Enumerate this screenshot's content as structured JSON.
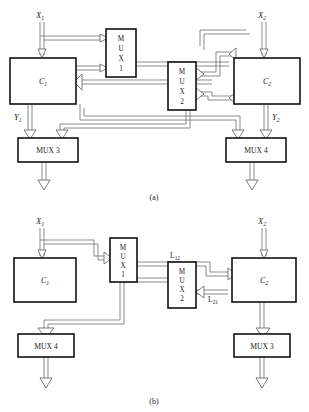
{
  "figure": {
    "captions": {
      "a": "(a)",
      "b": "(b)"
    }
  },
  "diagram_a": {
    "caption": "(a)",
    "inputs": [
      {
        "name": "input-x1",
        "label": "X",
        "sub": "1"
      },
      {
        "name": "input-x2",
        "label": "X",
        "sub": "2"
      }
    ],
    "outputs": [
      {
        "name": "output-y1",
        "label": "Y",
        "sub": "1"
      },
      {
        "name": "output-y2",
        "label": "Y",
        "sub": "2"
      }
    ],
    "blocks": [
      {
        "name": "block-c1",
        "label": "C",
        "sub": "1",
        "orient": "horizontal"
      },
      {
        "name": "block-c2",
        "label": "C",
        "sub": "2",
        "orient": "horizontal"
      },
      {
        "name": "block-mux1",
        "label": "MUX 1",
        "letters": [
          "M",
          "U",
          "X",
          "1"
        ],
        "orient": "vertical"
      },
      {
        "name": "block-mux2",
        "label": "MUX 2",
        "letters": [
          "M",
          "U",
          "X",
          "2"
        ],
        "orient": "vertical"
      },
      {
        "name": "block-mux3",
        "label": "MUX 3",
        "orient": "horizontal"
      },
      {
        "name": "block-mux4",
        "label": "MUX 4",
        "orient": "horizontal"
      }
    ]
  },
  "diagram_b": {
    "caption": "(b)",
    "inputs": [
      {
        "name": "input-x1",
        "label": "X",
        "sub": "1"
      },
      {
        "name": "input-x2",
        "label": "X",
        "sub": "2"
      }
    ],
    "blocks": [
      {
        "name": "block-c1",
        "label": "C",
        "sub": "1",
        "orient": "horizontal"
      },
      {
        "name": "block-c2",
        "label": "C",
        "sub": "2",
        "orient": "horizontal"
      },
      {
        "name": "block-mux1",
        "label": "MUX 1",
        "letters": [
          "M",
          "U",
          "X",
          "1"
        ],
        "orient": "vertical"
      },
      {
        "name": "block-mux2",
        "label": "MUX 2",
        "letters": [
          "M",
          "U",
          "X",
          "2"
        ],
        "orient": "vertical"
      },
      {
        "name": "block-mux4",
        "label": "MUX 4",
        "orient": "horizontal"
      },
      {
        "name": "block-mux3",
        "label": "MUX 3",
        "orient": "horizontal"
      }
    ],
    "signals": [
      {
        "name": "signal-l12",
        "label": "L",
        "sub": "12"
      },
      {
        "name": "signal-l21",
        "label": "L",
        "sub": "21"
      }
    ]
  },
  "colors": {
    "background": "#ffffff",
    "block_stroke": "#111111",
    "wire": "#6f6f6f",
    "text": "#1a1a1a"
  }
}
